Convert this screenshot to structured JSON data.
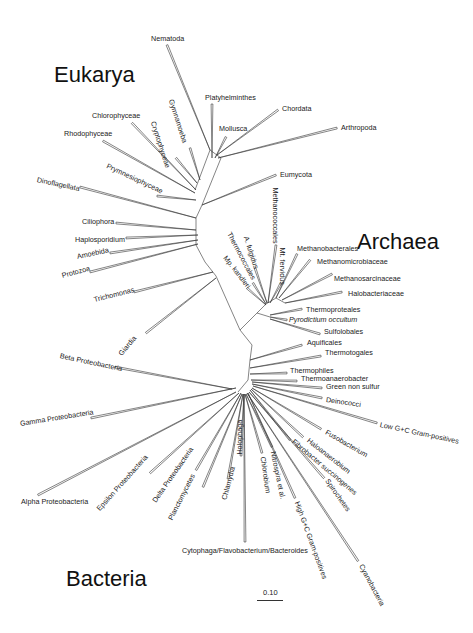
{
  "domains": {
    "eukarya": "Eukarya",
    "archaea": "Archaea",
    "bacteria": "Bacteria"
  },
  "scale": {
    "label": "0.10"
  },
  "colors": {
    "line": "#333333",
    "text": "#222222",
    "background": "#ffffff"
  },
  "taxa": [
    {
      "id": "nematoda",
      "label": "Nematoda",
      "x": 151,
      "y": 39,
      "rot": 0,
      "tip": [
        167,
        45
      ],
      "node": [
        210,
        150
      ]
    },
    {
      "id": "platyhelminthes",
      "label": "Platyhelminthes",
      "x": 205,
      "y": 98,
      "rot": 0,
      "tip": [
        212,
        104
      ],
      "node": [
        212,
        158
      ]
    },
    {
      "id": "chordata",
      "label": "Chordata",
      "x": 282,
      "y": 109,
      "rot": 0,
      "tip": [
        278,
        110
      ],
      "node": [
        217,
        155
      ]
    },
    {
      "id": "mollusca",
      "label": "Mollusca",
      "x": 219,
      "y": 129,
      "rot": 0,
      "tip": [
        226,
        137
      ],
      "node": [
        215,
        158
      ]
    },
    {
      "id": "arthropoda",
      "label": "Arthropoda",
      "x": 341,
      "y": 128,
      "rot": 0,
      "tip": [
        337,
        128
      ],
      "node": [
        218,
        158
      ]
    },
    {
      "id": "gymnamoeba",
      "label": "Gymnamoeba",
      "x": 171,
      "y": 100,
      "rot": 72,
      "tip": [
        190,
        148
      ],
      "node": [
        200,
        180
      ]
    },
    {
      "id": "cryptophyceae",
      "label": "Cryptophyceae",
      "x": 153,
      "y": 122,
      "rot": 72,
      "tip": [
        176,
        158
      ],
      "node": [
        197,
        183
      ]
    },
    {
      "id": "chlorophyceae",
      "label": "Chlorophyceae",
      "x": 92,
      "y": 116,
      "rot": 0,
      "tip": [
        132,
        123
      ],
      "node": [
        196,
        190
      ]
    },
    {
      "id": "rhodophyceae",
      "label": "Rhodophyceae",
      "x": 64,
      "y": 134,
      "rot": 0,
      "tip": [
        103,
        141
      ],
      "node": [
        195,
        193
      ]
    },
    {
      "id": "prymnesiophyceae",
      "label": "Prymnesiophyceae",
      "x": 107,
      "y": 166,
      "rot": 25,
      "tip": [
        157,
        196
      ],
      "node": [
        196,
        200
      ]
    },
    {
      "id": "eumycota",
      "label": "Eumycota",
      "x": 280,
      "y": 175,
      "rot": 0,
      "tip": [
        276,
        175
      ],
      "node": [
        202,
        205
      ]
    },
    {
      "id": "dinoflagellata",
      "label": "Dinoflagellata",
      "x": 37,
      "y": 180,
      "rot": 12,
      "tip": [
        80,
        187
      ],
      "node": [
        196,
        218
      ]
    },
    {
      "id": "ciliophora",
      "label": "Ciliophora",
      "x": 82,
      "y": 222,
      "rot": 0,
      "tip": [
        116,
        223
      ],
      "node": [
        196,
        230
      ]
    },
    {
      "id": "haplosporidium",
      "label": "Haplosporidium",
      "x": 75,
      "y": 240,
      "rot": 0,
      "tip": [
        126,
        238
      ],
      "node": [
        198,
        235
      ]
    },
    {
      "id": "amoebida",
      "label": "Amoebida",
      "x": 77,
      "y": 257,
      "rot": -12,
      "tip": [
        110,
        253
      ],
      "node": [
        198,
        240
      ]
    },
    {
      "id": "protozoa",
      "label": "Protozoa",
      "x": 62,
      "y": 276,
      "rot": -15,
      "tip": [
        90,
        272
      ],
      "node": [
        198,
        244
      ]
    },
    {
      "id": "trichomonas",
      "label": "Trichomonas",
      "x": 94,
      "y": 300,
      "rot": -14,
      "tip": [
        134,
        292
      ],
      "node": [
        213,
        272
      ]
    },
    {
      "id": "giardia",
      "label": "Giardia",
      "x": 120,
      "y": 355,
      "rot": -50,
      "tip": [
        146,
        333
      ],
      "node": [
        216,
        278
      ]
    },
    {
      "id": "methanococcales",
      "label": "Methanococcales",
      "x": 275,
      "y": 188,
      "rot": 90,
      "tip": [
        276,
        245
      ],
      "node": [
        268,
        303
      ]
    },
    {
      "id": "mt_fervidus",
      "label": "Mt. fervidus",
      "x": 282,
      "y": 248,
      "rot": 90,
      "tip": [
        281,
        283
      ],
      "node": [
        270,
        303
      ]
    },
    {
      "id": "a_fulgidus",
      "label": "A. fulgidus",
      "x": 246,
      "y": 237,
      "rot": 72,
      "tip": [
        255,
        268
      ],
      "node": [
        267,
        303
      ]
    },
    {
      "id": "thermococcales",
      "label": "Thermococcales",
      "x": 229,
      "y": 233,
      "rot": 62,
      "tip": [
        253,
        283
      ],
      "node": [
        266,
        304
      ]
    },
    {
      "id": "mp_kandleri",
      "label": "Mp. kandleri",
      "x": 225,
      "y": 257,
      "rot": 52,
      "tip": [
        247,
        288
      ],
      "node": [
        266,
        305
      ]
    },
    {
      "id": "methanobacterales",
      "label": "Methanobacterales",
      "x": 297,
      "y": 249,
      "rot": 0,
      "tip": [
        297,
        254
      ],
      "node": [
        276,
        298
      ]
    },
    {
      "id": "methanomicrobiaceae",
      "label": "Methanomicrobiaceae",
      "x": 317,
      "y": 262,
      "rot": 0,
      "tip": [
        310,
        260
      ],
      "node": [
        279,
        298
      ]
    },
    {
      "id": "methanosarcinaceae",
      "label": "Methanosarcinaceae",
      "x": 334,
      "y": 279,
      "rot": 0,
      "tip": [
        332,
        274
      ],
      "node": [
        282,
        300
      ]
    },
    {
      "id": "halobacteriaceae",
      "label": "Halobacteriaceae",
      "x": 348,
      "y": 294,
      "rot": 0,
      "tip": [
        342,
        292
      ],
      "node": [
        285,
        303
      ]
    },
    {
      "id": "thermoproteales",
      "label": "Thermoproteales",
      "x": 306,
      "y": 310,
      "rot": 0,
      "tip": [
        302,
        309
      ],
      "node": [
        270,
        315
      ]
    },
    {
      "id": "pyrodictium",
      "label": "Pyrodictium occultum",
      "x": 289,
      "y": 320,
      "rot": 0,
      "tip": [
        287,
        320
      ],
      "node": [
        270,
        317
      ],
      "italic": true
    },
    {
      "id": "sulfolobales",
      "label": "Sulfolobales",
      "x": 324,
      "y": 332,
      "rot": 0,
      "tip": [
        320,
        334
      ],
      "node": [
        270,
        319
      ]
    },
    {
      "id": "aquificales",
      "label": "Aquificales",
      "x": 307,
      "y": 343,
      "rot": 0,
      "tip": [
        302,
        345
      ],
      "node": [
        250,
        360
      ]
    },
    {
      "id": "thermotogales",
      "label": "Thermotogales",
      "x": 325,
      "y": 353,
      "rot": 0,
      "tip": [
        321,
        356
      ],
      "node": [
        250,
        368
      ]
    },
    {
      "id": "thermophiles",
      "label": "Thermophiles",
      "x": 290,
      "y": 371,
      "rot": 0,
      "tip": [
        287,
        373
      ],
      "node": [
        250,
        374
      ]
    },
    {
      "id": "thermoanaerobacter",
      "label": "Thermoanaerobacter",
      "x": 301,
      "y": 379,
      "rot": 0,
      "tip": [
        297,
        381
      ],
      "node": [
        251,
        380
      ]
    },
    {
      "id": "green_non_sulfur",
      "label": "Green non sulfur",
      "x": 326,
      "y": 387,
      "rot": 0,
      "tip": [
        322,
        388
      ],
      "node": [
        252,
        382
      ]
    },
    {
      "id": "deinococci",
      "label": "Deinococci",
      "x": 326,
      "y": 400,
      "rot": 8,
      "tip": [
        322,
        398
      ],
      "node": [
        252,
        384
      ]
    },
    {
      "id": "low_gc",
      "label": "Low G+C Gram-positives",
      "x": 380,
      "y": 425,
      "rot": 12,
      "tip": [
        377,
        423
      ],
      "node": [
        253,
        386
      ]
    },
    {
      "id": "fusobacterium",
      "label": "Fusobacterium",
      "x": 326,
      "y": 432,
      "rot": 30,
      "tip": [
        321,
        429
      ],
      "node": [
        252,
        388
      ]
    },
    {
      "id": "haloanaerobium",
      "label": "Haloanaerobium",
      "x": 308,
      "y": 440,
      "rot": 38,
      "tip": [
        303,
        437
      ],
      "node": [
        251,
        389
      ]
    },
    {
      "id": "fibrobacter",
      "label": "Fibrobacter succinogenes",
      "x": 293,
      "y": 441,
      "rot": 40,
      "tip": [
        290,
        440
      ],
      "node": [
        250,
        390
      ]
    },
    {
      "id": "spirochetes",
      "label": "Spirochetes",
      "x": 327,
      "y": 480,
      "rot": 55,
      "tip": [
        324,
        478
      ],
      "node": [
        249,
        392
      ]
    },
    {
      "id": "high_gc",
      "label": "High G+C Gram-positives",
      "x": 297,
      "y": 502,
      "rot": 70,
      "tip": [
        295,
        498
      ],
      "node": [
        248,
        393
      ]
    },
    {
      "id": "cyanobacteria",
      "label": "Cyanobacteria",
      "x": 361,
      "y": 565,
      "rot": 62,
      "tip": [
        358,
        561
      ],
      "node": [
        247,
        393
      ]
    },
    {
      "id": "nitrospira",
      "label": "Nitrospira et al.",
      "x": 273,
      "y": 452,
      "rot": 78,
      "tip": [
        272,
        447
      ],
      "node": [
        246,
        394
      ]
    },
    {
      "id": "chlorobium",
      "label": "Chlorobium",
      "x": 263,
      "y": 457,
      "rot": 82,
      "tip": [
        262,
        453
      ],
      "node": [
        245,
        394
      ]
    },
    {
      "id": "holophaga",
      "label": "Holophaga",
      "x": 240,
      "y": 455,
      "rot": -90,
      "tip": [
        241,
        456
      ],
      "node": [
        244,
        394
      ]
    },
    {
      "id": "chlamydia",
      "label": "Chlamydia",
      "x": 224,
      "y": 500,
      "rot": -75,
      "tip": [
        228,
        479
      ],
      "node": [
        243,
        394
      ]
    },
    {
      "id": "cytophaga",
      "label": "Cytophaga/Flavobacterium/Bacteroides",
      "x": 182,
      "y": 551,
      "rot": 0,
      "tip": [
        245,
        542
      ],
      "node": [
        244,
        394
      ]
    },
    {
      "id": "planctomycetes",
      "label": "Planctomycetes",
      "x": 170,
      "y": 520,
      "rot": -63,
      "tip": [
        203,
        487
      ],
      "node": [
        242,
        394
      ]
    },
    {
      "id": "delta_proteo",
      "label": "Delta Proteobacteria",
      "x": 154,
      "y": 502,
      "rot": -55,
      "tip": [
        196,
        470
      ],
      "node": [
        241,
        393
      ]
    },
    {
      "id": "epsilon_proteo",
      "label": "Epsilon Proteobacteria",
      "x": 98,
      "y": 510,
      "rot": -48,
      "tip": [
        150,
        473
      ],
      "node": [
        239,
        393
      ]
    },
    {
      "id": "alpha_proteo",
      "label": "Alpha Proteobacteria",
      "x": 21,
      "y": 502,
      "rot": 0,
      "tip": [
        38,
        495
      ],
      "node": [
        236,
        392
      ]
    },
    {
      "id": "gamma_proteo",
      "label": "Gamma Proteobacteria",
      "x": 20,
      "y": 424,
      "rot": -9,
      "tip": [
        91,
        418
      ],
      "node": [
        236,
        388
      ]
    },
    {
      "id": "beta_proteo",
      "label": "Beta Proteobacteria",
      "x": 60,
      "y": 356,
      "rot": 12,
      "tip": [
        115,
        367
      ],
      "node": [
        232,
        389
      ]
    }
  ],
  "backbone": [
    [
      [
        195,
        190
      ],
      [
        210,
        150
      ],
      [
        221,
        158
      ],
      [
        202,
        205
      ],
      [
        196,
        218
      ],
      [
        196,
        245
      ],
      [
        205,
        262
      ],
      [
        216,
        276
      ],
      [
        240,
        330
      ],
      [
        252,
        345
      ],
      [
        250,
        360
      ],
      [
        248,
        380
      ],
      [
        238,
        392
      ]
    ],
    [
      [
        240,
        330
      ],
      [
        257,
        313
      ],
      [
        266,
        304
      ],
      [
        276,
        298
      ],
      [
        285,
        303
      ]
    ],
    [
      [
        257,
        313
      ],
      [
        270,
        317
      ]
    ]
  ]
}
